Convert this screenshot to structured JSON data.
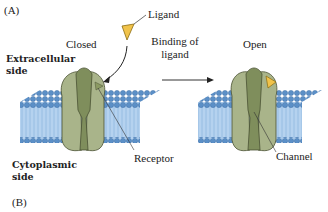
{
  "figure": {
    "panel_a_label": "(A)",
    "panel_b_label": "(B)",
    "state_closed": "Closed",
    "state_open": "Open",
    "ligand_label": "Ligand",
    "transition_label_line1": "Binding of",
    "transition_label_line2": "ligand",
    "extracellular_line1": "Extracellular",
    "extracellular_line2": "side",
    "cytoplasmic_line1": "Cytoplasmic",
    "cytoplasmic_line2": "side",
    "receptor_label": "Receptor",
    "channel_label": "Channel"
  },
  "colors": {
    "membrane_blue": "#8fb8e0",
    "lipid_head": "#5b8fc7",
    "protein_green": "#a9b48a",
    "protein_dark_green": "#7f8e5c",
    "ligand_yellow": "#f1c34a"
  }
}
